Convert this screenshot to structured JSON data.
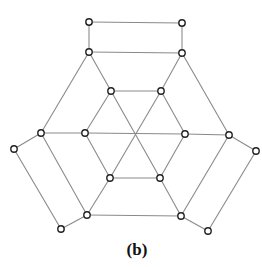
{
  "figure": {
    "caption": "(b)",
    "colors": {
      "edge": "#8a8a8a",
      "node_stroke": "#222222",
      "node_fill": "#ffffff"
    },
    "node_radius": 3.2,
    "nodes": [
      {
        "id": "A",
        "x": 89,
        "y": 22
      },
      {
        "id": "B",
        "x": 182,
        "y": 23
      },
      {
        "id": "C",
        "x": 89,
        "y": 52
      },
      {
        "id": "D",
        "x": 182,
        "y": 53
      },
      {
        "id": "I1",
        "x": 111,
        "y": 91
      },
      {
        "id": "I2",
        "x": 161,
        "y": 91
      },
      {
        "id": "L1",
        "x": 41,
        "y": 133
      },
      {
        "id": "I3",
        "x": 85,
        "y": 133
      },
      {
        "id": "I4",
        "x": 185,
        "y": 134
      },
      {
        "id": "R1",
        "x": 229,
        "y": 135
      },
      {
        "id": "LL",
        "x": 14,
        "y": 149
      },
      {
        "id": "RR",
        "x": 256,
        "y": 151
      },
      {
        "id": "I5",
        "x": 110,
        "y": 178
      },
      {
        "id": "I6",
        "x": 160,
        "y": 178
      },
      {
        "id": "BL",
        "x": 87,
        "y": 215
      },
      {
        "id": "BR",
        "x": 181,
        "y": 216
      },
      {
        "id": "LB",
        "x": 61,
        "y": 229
      },
      {
        "id": "RB",
        "x": 208,
        "y": 231
      }
    ],
    "edges": [
      [
        "A",
        "B"
      ],
      [
        "A",
        "C"
      ],
      [
        "B",
        "D"
      ],
      [
        "C",
        "D"
      ],
      [
        "C",
        "L1"
      ],
      [
        "C",
        "I1"
      ],
      [
        "D",
        "R1"
      ],
      [
        "D",
        "I2"
      ],
      [
        "I1",
        "I2"
      ],
      [
        "I1",
        "I3"
      ],
      [
        "I2",
        "I4"
      ],
      [
        "I3",
        "I5"
      ],
      [
        "I4",
        "I6"
      ],
      [
        "I5",
        "I6"
      ],
      [
        "I1",
        "I6"
      ],
      [
        "I2",
        "I5"
      ],
      [
        "I3",
        "I4"
      ],
      [
        "I6",
        "BR"
      ],
      [
        "I5",
        "BL"
      ],
      [
        "L1",
        "I3"
      ],
      [
        "I4",
        "R1"
      ],
      [
        "L1",
        "BL"
      ],
      [
        "R1",
        "BR"
      ],
      [
        "BL",
        "BR"
      ],
      [
        "L1",
        "LL"
      ],
      [
        "LL",
        "LB"
      ],
      [
        "LB",
        "BL"
      ],
      [
        "R1",
        "RR"
      ],
      [
        "RR",
        "RB"
      ],
      [
        "RB",
        "BR"
      ]
    ]
  }
}
